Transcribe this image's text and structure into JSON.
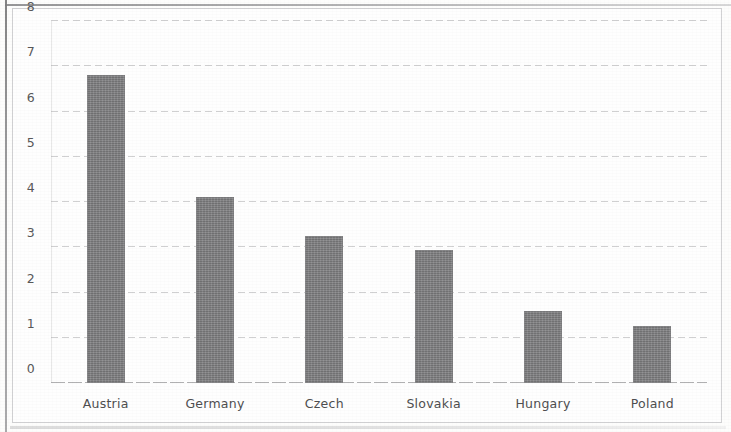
{
  "chart_data": {
    "type": "bar",
    "title": "",
    "subtitle": "",
    "xlabel": "",
    "ylabel": "",
    "categories": [
      "Austria",
      "Germany",
      "Czech",
      "Slovakia",
      "Hungary",
      "Poland"
    ],
    "values": [
      6.8,
      4.1,
      3.25,
      2.95,
      1.6,
      1.25
    ],
    "series": [
      {
        "name": "",
        "values": [
          6.8,
          4.1,
          3.25,
          2.95,
          1.6,
          1.25
        ]
      }
    ],
    "ylim": [
      0,
      8
    ],
    "ytick_labels": [
      "0",
      "1",
      "2",
      "3",
      "4",
      "5",
      "6",
      "7",
      "8"
    ],
    "ytick_values": [
      0,
      1,
      2,
      3,
      4,
      5,
      6,
      7,
      8
    ],
    "grid": true,
    "grid_axis": "y",
    "legend": false,
    "legend_position": "none",
    "bar_color": "#7e7e80",
    "gridline_color": "#aaaaac",
    "tick_label_color": "#585859",
    "plot_background": "#fefefe",
    "frame_border_color": "#d2d2d4"
  }
}
